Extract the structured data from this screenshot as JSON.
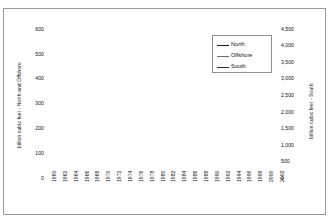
{
  "chart_data": {
    "type": "line",
    "title": "",
    "xlabel": "",
    "x": [
      1960,
      1961,
      1962,
      1963,
      1964,
      1965,
      1966,
      1967,
      1968,
      1969,
      1970,
      1971,
      1972,
      1973,
      1974,
      1975,
      1976,
      1977,
      1978,
      1979,
      1980,
      1981,
      1982,
      1983,
      1984,
      1985,
      1986,
      1987,
      1988,
      1989,
      1990,
      1991,
      1992,
      1993,
      1994,
      1995,
      1996,
      1997,
      1998,
      1999,
      2000,
      2001,
      2002
    ],
    "xlim": [
      1960,
      2002
    ],
    "xtick_labels": [
      "1960",
      "1962",
      "1964",
      "1966",
      "1968",
      "1970",
      "1972",
      "1974",
      "1976",
      "1978",
      "1980",
      "1982",
      "1984",
      "1986",
      "1988",
      "1990",
      "1992",
      "1994",
      "1996",
      "1998",
      "2000",
      "2002"
    ],
    "grid": true,
    "legend_position": "top-right",
    "axes": [
      {
        "id": "left",
        "ylabel": "billion cubic feet - North and Offshore",
        "ylim": [
          0,
          600
        ],
        "ytick_labels": [
          "0",
          "100",
          "200",
          "300",
          "400",
          "500",
          "600"
        ],
        "ytick_values": [
          0,
          100,
          200,
          300,
          400,
          500,
          600
        ],
        "series_ids": [
          "North",
          "Offshore"
        ]
      },
      {
        "id": "right",
        "ylabel": "billion cubic feet - South",
        "ylim": [
          0,
          4500
        ],
        "ytick_labels": [
          "0",
          "500",
          "1,000",
          "1,500",
          "2,000",
          "2,500",
          "3,000",
          "3,500",
          "4,000",
          "4,500"
        ],
        "ytick_values": [
          0,
          500,
          1000,
          1500,
          2000,
          2500,
          3000,
          3500,
          4000,
          4500
        ],
        "series_ids": [
          "South"
        ]
      }
    ],
    "series": [
      {
        "name": "North",
        "axis": "left",
        "color": "#1a1a1a",
        "width": 1.6,
        "values": [
          502,
          497,
          500,
          520,
          548,
          557,
          530,
          519,
          500,
          470,
          444,
          436,
          403,
          390,
          392,
          376,
          355,
          348,
          340,
          311,
          311,
          305,
          307,
          320,
          316,
          354,
          344,
          318,
          310,
          299,
          303,
          311,
          322,
          330,
          350,
          356,
          349,
          342,
          339,
          336,
          341,
          352,
          368
        ]
      },
      {
        "name": "Offshore",
        "axis": "left",
        "color": "#6e6e6e",
        "width": 1.4,
        "values": [
          80,
          84,
          88,
          92,
          96,
          99,
          103,
          140,
          200,
          285,
          398,
          466,
          540,
          544,
          536,
          514,
          497,
          480,
          470,
          474,
          470,
          465,
          462,
          471,
          477,
          452,
          434,
          424,
          432,
          440,
          404,
          349,
          331,
          320,
          302,
          262,
          250,
          235,
          217,
          205,
          198,
          190,
          182
        ]
      },
      {
        "name": "South",
        "axis": "right",
        "color": "#2a2a2a",
        "width": 1.6,
        "values": [
          1730,
          1820,
          1930,
          2050,
          2180,
          2300,
          2460,
          2700,
          2950,
          3180,
          3330,
          3390,
          3360,
          3240,
          3060,
          2870,
          2690,
          2520,
          2360,
          2210,
          2080,
          1880,
          1650,
          1450,
          1270,
          1180,
          1130,
          1090,
          1065,
          1050,
          1040,
          1035,
          1020,
          1000,
          980,
          960,
          1010,
          1120,
          1240,
          1160,
          1065,
          1040,
          1010
        ]
      }
    ],
    "legend_entries": [
      {
        "label": "North",
        "color": "#1a1a1a",
        "width": 1.8
      },
      {
        "label": "Offshore",
        "color": "#6e6e6e",
        "width": 1.4
      },
      {
        "label": "South",
        "color": "#2a2a2a",
        "width": 1.8
      }
    ]
  }
}
